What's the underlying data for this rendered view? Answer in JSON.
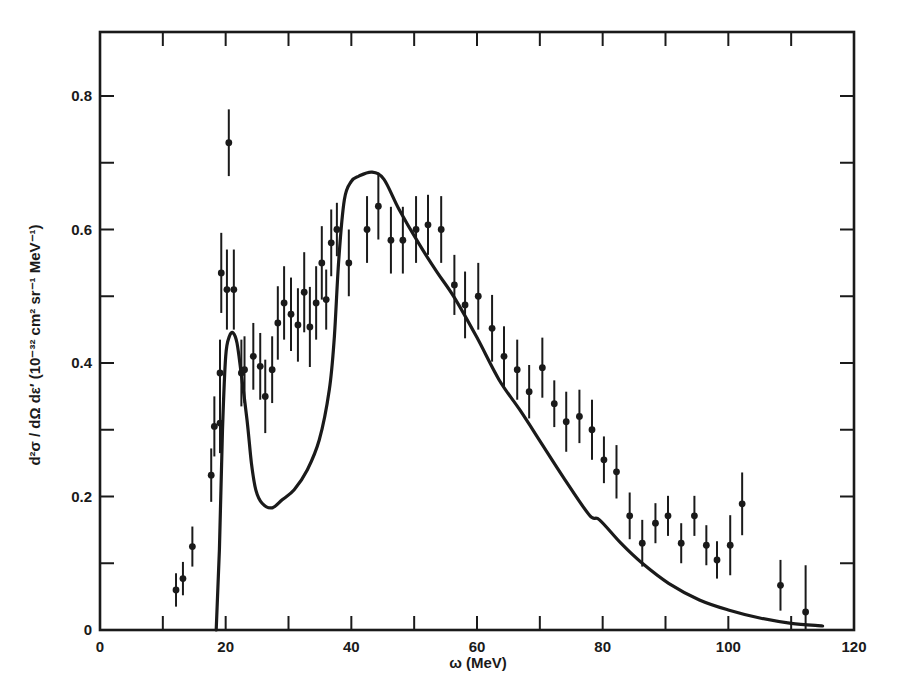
{
  "chart_data": {
    "type": "scatter",
    "title": "",
    "xlabel": "ω (MeV)",
    "ylabel": "d²σ / dΩ dε′ (10⁻³² cm² sr⁻¹ MeV⁻¹)",
    "xlim": [
      0,
      120
    ],
    "ylim": [
      0,
      0.8
    ],
    "x_ticks": [
      0,
      20,
      40,
      60,
      80,
      100,
      120
    ],
    "x_tick_labels": [
      "0",
      "20",
      "40",
      "60",
      "80",
      "100",
      "120"
    ],
    "x_minor_step": 10,
    "y_ticks": [
      0,
      0.2,
      0.4,
      0.6,
      0.8
    ],
    "y_tick_labels": [
      "0",
      "0.2",
      "0.4",
      "0.6",
      "0.8"
    ],
    "y_minor_step": 0.1,
    "grid": false,
    "legend": null,
    "series": [
      {
        "name": "data",
        "kind": "points_with_error_bars",
        "points": [
          {
            "x": 12.1,
            "y": 0.06,
            "err": 0.025
          },
          {
            "x": 13.2,
            "y": 0.077,
            "err": 0.025
          },
          {
            "x": 14.7,
            "y": 0.125,
            "err": 0.03
          },
          {
            "x": 17.7,
            "y": 0.232,
            "err": 0.04
          },
          {
            "x": 18.2,
            "y": 0.305,
            "err": 0.045
          },
          {
            "x": 19.1,
            "y": 0.31,
            "err": 0.045
          },
          {
            "x": 19.1,
            "y": 0.385,
            "err": 0.05
          },
          {
            "x": 19.3,
            "y": 0.535,
            "err": 0.06
          },
          {
            "x": 20.2,
            "y": 0.51,
            "err": 0.06
          },
          {
            "x": 20.5,
            "y": 0.73,
            "err": 0.05
          },
          {
            "x": 21.3,
            "y": 0.51,
            "err": 0.06
          },
          {
            "x": 22.5,
            "y": 0.385,
            "err": 0.05
          },
          {
            "x": 23.0,
            "y": 0.39,
            "err": 0.05
          },
          {
            "x": 24.4,
            "y": 0.41,
            "err": 0.05
          },
          {
            "x": 25.5,
            "y": 0.395,
            "err": 0.05
          },
          {
            "x": 26.3,
            "y": 0.35,
            "err": 0.055
          },
          {
            "x": 27.4,
            "y": 0.39,
            "err": 0.05
          },
          {
            "x": 28.3,
            "y": 0.46,
            "err": 0.055
          },
          {
            "x": 29.3,
            "y": 0.49,
            "err": 0.055
          },
          {
            "x": 30.4,
            "y": 0.473,
            "err": 0.055
          },
          {
            "x": 31.5,
            "y": 0.457,
            "err": 0.055
          },
          {
            "x": 32.5,
            "y": 0.506,
            "err": 0.06
          },
          {
            "x": 33.4,
            "y": 0.454,
            "err": 0.06
          },
          {
            "x": 34.4,
            "y": 0.49,
            "err": 0.055
          },
          {
            "x": 35.3,
            "y": 0.55,
            "err": 0.055
          },
          {
            "x": 36.0,
            "y": 0.495,
            "err": 0.045
          },
          {
            "x": 36.8,
            "y": 0.58,
            "err": 0.05
          },
          {
            "x": 37.7,
            "y": 0.6,
            "err": 0.04
          },
          {
            "x": 39.6,
            "y": 0.55,
            "err": 0.05
          },
          {
            "x": 42.5,
            "y": 0.6,
            "err": 0.05
          },
          {
            "x": 44.3,
            "y": 0.635,
            "err": 0.05
          },
          {
            "x": 46.3,
            "y": 0.584,
            "err": 0.05
          },
          {
            "x": 48.2,
            "y": 0.584,
            "err": 0.05
          },
          {
            "x": 50.3,
            "y": 0.6,
            "err": 0.05
          },
          {
            "x": 52.2,
            "y": 0.607,
            "err": 0.045
          },
          {
            "x": 54.3,
            "y": 0.6,
            "err": 0.05
          },
          {
            "x": 56.4,
            "y": 0.517,
            "err": 0.045
          },
          {
            "x": 58.1,
            "y": 0.487,
            "err": 0.05
          },
          {
            "x": 60.2,
            "y": 0.5,
            "err": 0.05
          },
          {
            "x": 62.4,
            "y": 0.452,
            "err": 0.05
          },
          {
            "x": 64.3,
            "y": 0.41,
            "err": 0.045
          },
          {
            "x": 66.4,
            "y": 0.39,
            "err": 0.045
          },
          {
            "x": 68.3,
            "y": 0.357,
            "err": 0.04
          },
          {
            "x": 70.4,
            "y": 0.393,
            "err": 0.045
          },
          {
            "x": 72.3,
            "y": 0.339,
            "err": 0.035
          },
          {
            "x": 74.2,
            "y": 0.312,
            "err": 0.045
          },
          {
            "x": 76.3,
            "y": 0.32,
            "err": 0.04
          },
          {
            "x": 78.3,
            "y": 0.3,
            "err": 0.045
          },
          {
            "x": 80.2,
            "y": 0.255,
            "err": 0.035
          },
          {
            "x": 82.2,
            "y": 0.237,
            "err": 0.04
          },
          {
            "x": 84.3,
            "y": 0.171,
            "err": 0.035
          },
          {
            "x": 86.3,
            "y": 0.13,
            "err": 0.035
          },
          {
            "x": 88.4,
            "y": 0.16,
            "err": 0.03
          },
          {
            "x": 90.4,
            "y": 0.171,
            "err": 0.03
          },
          {
            "x": 92.5,
            "y": 0.13,
            "err": 0.03
          },
          {
            "x": 94.6,
            "y": 0.171,
            "err": 0.03
          },
          {
            "x": 96.5,
            "y": 0.127,
            "err": 0.03
          },
          {
            "x": 98.2,
            "y": 0.105,
            "err": 0.028
          },
          {
            "x": 100.3,
            "y": 0.127,
            "err": 0.045
          },
          {
            "x": 102.2,
            "y": 0.189,
            "err": 0.047
          },
          {
            "x": 108.3,
            "y": 0.067,
            "err": 0.038
          },
          {
            "x": 112.3,
            "y": 0.027,
            "err": 0.07
          }
        ]
      },
      {
        "name": "theory",
        "kind": "line",
        "points": [
          {
            "x": 18.5,
            "y": 0.0
          },
          {
            "x": 19.0,
            "y": 0.12
          },
          {
            "x": 19.5,
            "y": 0.3
          },
          {
            "x": 20.0,
            "y": 0.41
          },
          {
            "x": 20.6,
            "y": 0.44
          },
          {
            "x": 21.2,
            "y": 0.445
          },
          {
            "x": 21.8,
            "y": 0.43
          },
          {
            "x": 22.4,
            "y": 0.39
          },
          {
            "x": 23.4,
            "y": 0.315
          },
          {
            "x": 24.1,
            "y": 0.25
          },
          {
            "x": 24.8,
            "y": 0.21
          },
          {
            "x": 25.8,
            "y": 0.19
          },
          {
            "x": 27.4,
            "y": 0.183
          },
          {
            "x": 29.0,
            "y": 0.195
          },
          {
            "x": 30.9,
            "y": 0.21
          },
          {
            "x": 33.0,
            "y": 0.24
          },
          {
            "x": 34.9,
            "y": 0.285
          },
          {
            "x": 36.5,
            "y": 0.36
          },
          {
            "x": 37.3,
            "y": 0.44
          },
          {
            "x": 38.0,
            "y": 0.555
          },
          {
            "x": 38.9,
            "y": 0.645
          },
          {
            "x": 40.0,
            "y": 0.672
          },
          {
            "x": 41.2,
            "y": 0.68
          },
          {
            "x": 43.3,
            "y": 0.686
          },
          {
            "x": 45.2,
            "y": 0.675
          },
          {
            "x": 47.6,
            "y": 0.63
          },
          {
            "x": 50.8,
            "y": 0.578
          },
          {
            "x": 53.5,
            "y": 0.538
          },
          {
            "x": 56.4,
            "y": 0.498
          },
          {
            "x": 60.0,
            "y": 0.438
          },
          {
            "x": 63.5,
            "y": 0.375
          },
          {
            "x": 66.8,
            "y": 0.33
          },
          {
            "x": 69.9,
            "y": 0.285
          },
          {
            "x": 73.8,
            "y": 0.228
          },
          {
            "x": 77.9,
            "y": 0.172
          },
          {
            "x": 79.5,
            "y": 0.165
          },
          {
            "x": 82.9,
            "y": 0.13
          },
          {
            "x": 86.3,
            "y": 0.1
          },
          {
            "x": 90.5,
            "y": 0.07
          },
          {
            "x": 95.4,
            "y": 0.045
          },
          {
            "x": 100.0,
            "y": 0.03
          },
          {
            "x": 105.0,
            "y": 0.018
          },
          {
            "x": 110.0,
            "y": 0.01
          },
          {
            "x": 115.0,
            "y": 0.006
          }
        ]
      }
    ],
    "colors": {
      "ink": "#1a1a1a",
      "background": "#ffffff"
    }
  }
}
